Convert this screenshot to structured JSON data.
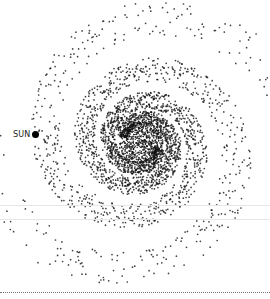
{
  "diagram": {
    "type": "spiral-galaxy",
    "center": [
      141,
      143
    ],
    "core_radius": 22,
    "arms": 2,
    "colors": {
      "dots": "#111111",
      "background": "#ffffff",
      "rule": "#777777"
    }
  },
  "labels": {
    "sun": "SUN"
  }
}
